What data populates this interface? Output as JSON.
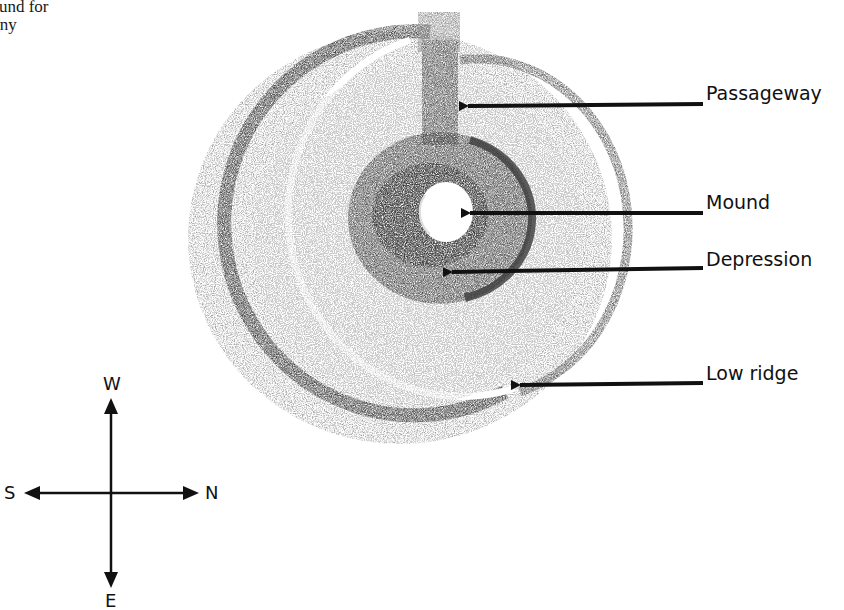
{
  "caption": {
    "line1": "onial ground for",
    "line2": "e ceremony"
  },
  "figure": {
    "labels": [
      {
        "id": "passageway",
        "text": "Passageway"
      },
      {
        "id": "mound",
        "text": "Mound"
      },
      {
        "id": "depression",
        "text": "Depression"
      },
      {
        "id": "low-ridge",
        "text": "Low ridge"
      }
    ]
  },
  "compass": {
    "up": "W",
    "down": "E",
    "left": "S",
    "right": "N"
  },
  "colors": {
    "ink": "#111111",
    "shading_dark": "#3a3a3a",
    "shading_mid": "#7a7a7a",
    "shading_light": "#b8b8b8",
    "paper": "#ffffff"
  }
}
